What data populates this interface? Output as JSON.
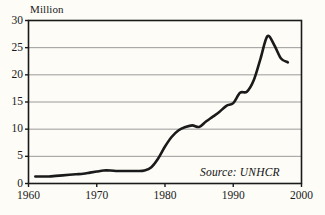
{
  "chart_data": {
    "type": "line",
    "title": "",
    "ylabel": "Million",
    "xlabel": "",
    "xlim": [
      1960,
      2000
    ],
    "ylim": [
      0,
      30
    ],
    "grid": true,
    "legend": null,
    "y_ticks": [
      0,
      5,
      10,
      15,
      20,
      25,
      30
    ],
    "y_tick_labels": [
      "0",
      "5",
      "10",
      "15",
      "20",
      "25",
      "30"
    ],
    "x_ticks": [
      1960,
      1970,
      1980,
      1990,
      2000
    ],
    "x_tick_labels": [
      "1960",
      "1970",
      "1980",
      "1990",
      "2000"
    ],
    "annotations": [
      {
        "name": "source",
        "text": "Source: UNHCR",
        "style": "italic"
      }
    ],
    "series": [
      {
        "name": "Refugees",
        "color": "#1a1a1a",
        "x": [
          1961,
          1962,
          1963,
          1964,
          1965,
          1966,
          1967,
          1968,
          1969,
          1970,
          1971,
          1972,
          1973,
          1974,
          1975,
          1976,
          1977,
          1978,
          1979,
          1980,
          1981,
          1982,
          1983,
          1984,
          1985,
          1986,
          1987,
          1988,
          1989,
          1990,
          1991,
          1992,
          1993,
          1994,
          1995,
          1996,
          1997,
          1998
        ],
        "values": [
          1.3,
          1.3,
          1.3,
          1.4,
          1.5,
          1.6,
          1.7,
          1.8,
          2.0,
          2.2,
          2.4,
          2.4,
          2.3,
          2.3,
          2.3,
          2.3,
          2.4,
          3.0,
          4.6,
          6.8,
          8.6,
          9.8,
          10.4,
          10.7,
          10.4,
          11.4,
          12.3,
          13.2,
          14.3,
          14.8,
          16.7,
          16.9,
          19.0,
          23.0,
          27.1,
          25.5,
          23.0,
          22.3
        ]
      }
    ]
  },
  "axis": {
    "y_title": "Million"
  },
  "colors": {
    "line": "#1a1a1a",
    "grid": "#9a9a9a",
    "axis": "#1a1a1a",
    "background": "#fdfcf7",
    "text": "#1a1a1a"
  }
}
